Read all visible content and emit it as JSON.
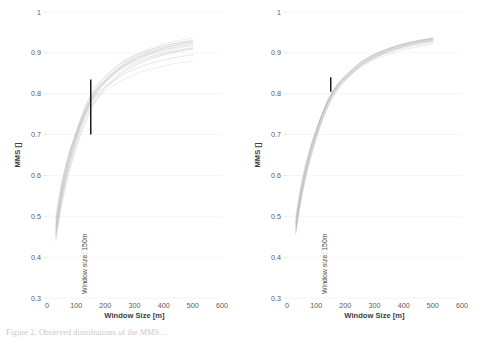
{
  "figure": {
    "caption": "Figure 2. Observed distributions of the MMS ...",
    "background": "#ffffff",
    "axis_color": "#5a5a5a",
    "grid_color": "#f0f0f0",
    "curve_color": "#b4b4b4",
    "marker_color": "#1c1c1c"
  },
  "chart_data": [
    {
      "type": "line",
      "panel": "left",
      "title": "",
      "xlabel": "Window Size [m]",
      "ylabel": "MMS []",
      "xlim": [
        0,
        600
      ],
      "ylim": [
        0.3,
        1
      ],
      "xticks": [
        0,
        100,
        200,
        300,
        400,
        500,
        600
      ],
      "xtick_labels": [
        "0",
        "100",
        "200",
        "300",
        "400",
        "500",
        "600"
      ],
      "yticks": [
        0.3,
        0.4,
        0.5,
        0.6,
        0.7,
        0.8,
        0.9,
        1
      ],
      "ytick_labels": [
        "0.3",
        "0.4",
        "0.5",
        "0.6",
        "0.7",
        "0.8",
        "0.9",
        "1"
      ],
      "grid": true,
      "legend": "none",
      "annotation": {
        "label": "Window size: 150m",
        "x": 150,
        "y_start": 0.7,
        "y_end": 0.835,
        "label_y": 0.3
      },
      "x": [
        30,
        50,
        75,
        100,
        125,
        150,
        175,
        200,
        250,
        300,
        350,
        400,
        450,
        500
      ],
      "series": [
        {
          "name": "run-01",
          "values": [
            0.47,
            0.56,
            0.64,
            0.7,
            0.752,
            0.793,
            0.82,
            0.84,
            0.873,
            0.895,
            0.911,
            0.922,
            0.93,
            0.936
          ]
        },
        {
          "name": "run-02",
          "values": [
            0.463,
            0.552,
            0.632,
            0.693,
            0.745,
            0.786,
            0.814,
            0.835,
            0.868,
            0.89,
            0.906,
            0.917,
            0.925,
            0.931
          ]
        },
        {
          "name": "run-03",
          "values": [
            0.478,
            0.568,
            0.648,
            0.707,
            0.758,
            0.798,
            0.824,
            0.843,
            0.873,
            0.893,
            0.907,
            0.917,
            0.924,
            0.929
          ]
        },
        {
          "name": "run-04",
          "values": [
            0.455,
            0.543,
            0.623,
            0.684,
            0.736,
            0.778,
            0.806,
            0.827,
            0.86,
            0.882,
            0.897,
            0.908,
            0.915,
            0.921
          ]
        },
        {
          "name": "run-05",
          "values": [
            0.485,
            0.575,
            0.652,
            0.708,
            0.755,
            0.791,
            0.815,
            0.832,
            0.859,
            0.877,
            0.89,
            0.899,
            0.906,
            0.911
          ]
        },
        {
          "name": "run-06",
          "values": [
            0.448,
            0.535,
            0.614,
            0.675,
            0.727,
            0.768,
            0.797,
            0.818,
            0.851,
            0.873,
            0.888,
            0.899,
            0.907,
            0.913
          ]
        },
        {
          "name": "run-07",
          "values": [
            0.492,
            0.578,
            0.65,
            0.702,
            0.745,
            0.778,
            0.8,
            0.816,
            0.842,
            0.86,
            0.873,
            0.883,
            0.89,
            0.896
          ]
        },
        {
          "name": "run-08",
          "values": [
            0.44,
            0.527,
            0.606,
            0.667,
            0.719,
            0.761,
            0.79,
            0.812,
            0.846,
            0.868,
            0.884,
            0.895,
            0.903,
            0.909
          ]
        },
        {
          "name": "run-09",
          "values": [
            0.5,
            0.582,
            0.65,
            0.699,
            0.739,
            0.77,
            0.791,
            0.806,
            0.83,
            0.847,
            0.859,
            0.868,
            0.875,
            0.88
          ]
        },
        {
          "name": "run-10",
          "values": [
            0.475,
            0.563,
            0.641,
            0.699,
            0.748,
            0.786,
            0.812,
            0.831,
            0.861,
            0.881,
            0.895,
            0.905,
            0.912,
            0.918
          ]
        },
        {
          "name": "run-11",
          "values": [
            0.468,
            0.556,
            0.636,
            0.696,
            0.747,
            0.787,
            0.814,
            0.834,
            0.866,
            0.887,
            0.902,
            0.913,
            0.921,
            0.927
          ]
        },
        {
          "name": "run-12",
          "values": [
            0.458,
            0.547,
            0.627,
            0.688,
            0.74,
            0.781,
            0.809,
            0.83,
            0.863,
            0.885,
            0.9,
            0.911,
            0.919,
            0.925
          ]
        }
      ]
    },
    {
      "type": "line",
      "panel": "right",
      "title": "",
      "xlabel": "Window Size [m]",
      "ylabel": "MMS []",
      "xlim": [
        0,
        600
      ],
      "ylim": [
        0.3,
        1
      ],
      "xticks": [
        0,
        100,
        200,
        300,
        400,
        500,
        600
      ],
      "xtick_labels": [
        "0",
        "100",
        "200",
        "300",
        "400",
        "500",
        "600"
      ],
      "yticks": [
        0.3,
        0.4,
        0.5,
        0.6,
        0.7,
        0.8,
        0.9,
        1
      ],
      "ytick_labels": [
        "0.3",
        "0.4",
        "0.5",
        "0.6",
        "0.7",
        "0.8",
        "0.9",
        "1"
      ],
      "grid": true,
      "legend": "none",
      "annotation": {
        "label": "Window size: 150m",
        "x": 150,
        "y_start": 0.805,
        "y_end": 0.84,
        "label_y": 0.3
      },
      "x": [
        30,
        50,
        75,
        100,
        125,
        150,
        175,
        200,
        250,
        300,
        350,
        400,
        450,
        500
      ],
      "series": [
        {
          "name": "run-01",
          "values": [
            0.478,
            0.566,
            0.646,
            0.706,
            0.757,
            0.797,
            0.824,
            0.844,
            0.876,
            0.897,
            0.912,
            0.923,
            0.931,
            0.937
          ]
        },
        {
          "name": "run-02",
          "values": [
            0.472,
            0.56,
            0.64,
            0.701,
            0.752,
            0.792,
            0.82,
            0.84,
            0.873,
            0.894,
            0.91,
            0.921,
            0.929,
            0.935
          ]
        },
        {
          "name": "run-03",
          "values": [
            0.484,
            0.572,
            0.65,
            0.709,
            0.759,
            0.798,
            0.825,
            0.844,
            0.875,
            0.896,
            0.91,
            0.92,
            0.928,
            0.933
          ]
        },
        {
          "name": "run-04",
          "values": [
            0.466,
            0.554,
            0.634,
            0.696,
            0.747,
            0.788,
            0.816,
            0.836,
            0.869,
            0.891,
            0.906,
            0.917,
            0.925,
            0.931
          ]
        },
        {
          "name": "run-05",
          "values": [
            0.489,
            0.576,
            0.652,
            0.71,
            0.758,
            0.796,
            0.822,
            0.84,
            0.87,
            0.89,
            0.904,
            0.914,
            0.922,
            0.928
          ]
        },
        {
          "name": "run-06",
          "values": [
            0.461,
            0.549,
            0.63,
            0.692,
            0.744,
            0.785,
            0.813,
            0.834,
            0.867,
            0.889,
            0.905,
            0.916,
            0.924,
            0.93
          ]
        },
        {
          "name": "run-07",
          "values": [
            0.494,
            0.58,
            0.655,
            0.711,
            0.758,
            0.795,
            0.82,
            0.838,
            0.867,
            0.887,
            0.901,
            0.911,
            0.919,
            0.925
          ]
        },
        {
          "name": "run-08",
          "values": [
            0.457,
            0.545,
            0.626,
            0.688,
            0.741,
            0.782,
            0.811,
            0.832,
            0.866,
            0.888,
            0.904,
            0.915,
            0.924,
            0.93
          ]
        },
        {
          "name": "run-09",
          "values": [
            0.5,
            0.584,
            0.657,
            0.712,
            0.757,
            0.793,
            0.817,
            0.835,
            0.863,
            0.883,
            0.897,
            0.907,
            0.915,
            0.921
          ]
        },
        {
          "name": "run-10",
          "values": [
            0.475,
            0.563,
            0.643,
            0.704,
            0.755,
            0.795,
            0.822,
            0.842,
            0.875,
            0.896,
            0.911,
            0.922,
            0.93,
            0.936
          ]
        },
        {
          "name": "run-11",
          "values": [
            0.469,
            0.557,
            0.637,
            0.699,
            0.75,
            0.79,
            0.818,
            0.838,
            0.871,
            0.893,
            0.908,
            0.919,
            0.928,
            0.934
          ]
        },
        {
          "name": "run-12",
          "values": [
            0.481,
            0.569,
            0.648,
            0.707,
            0.757,
            0.796,
            0.823,
            0.842,
            0.874,
            0.895,
            0.91,
            0.921,
            0.929,
            0.935
          ]
        }
      ]
    }
  ]
}
